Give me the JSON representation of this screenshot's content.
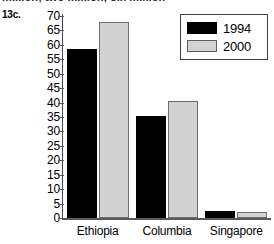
{
  "figure": {
    "number_label": "13c.",
    "cut_off_caption": "million; two million; six million"
  },
  "chart_data": {
    "type": "bar",
    "title": "",
    "xlabel": "",
    "ylabel": "",
    "categories": [
      "Ethiopia",
      "Columbia",
      "Singapore"
    ],
    "series": [
      {
        "name": "1994",
        "color": "#000000",
        "values": [
          58.5,
          35.5,
          2.5
        ]
      },
      {
        "name": "2000",
        "color": "#d2d2d2",
        "values": [
          68,
          40.5,
          2
        ]
      }
    ],
    "ylim": [
      0,
      70
    ],
    "ytick_step": 5,
    "ytick_labels": [
      "70",
      "65",
      "60",
      "55",
      "50",
      "45",
      "40",
      "35",
      "30",
      "25",
      "20",
      "15",
      "10",
      "5",
      "0"
    ],
    "grid": false,
    "legend_position": "top-right",
    "legend_entries": [
      "1994",
      "2000"
    ]
  }
}
